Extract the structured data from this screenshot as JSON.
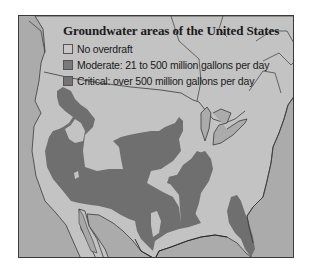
{
  "map": {
    "title": "Groundwater areas of the United States",
    "colors": {
      "ocean": "#ababab",
      "land": "#c3c3c3",
      "moderate": "#777777",
      "critical": "#6e6e6e",
      "outline": "#3a3a3a",
      "frame": "#3a3a3a"
    },
    "legend": {
      "items": [
        {
          "label": "No overdraft",
          "color": "#c8c8c8"
        },
        {
          "label": "Moderate: 21 to 500 million gallons per day",
          "color": "#7a7a7a"
        },
        {
          "label": "Critical: over 500 million gallons per day",
          "color": "#737373"
        }
      ]
    }
  }
}
